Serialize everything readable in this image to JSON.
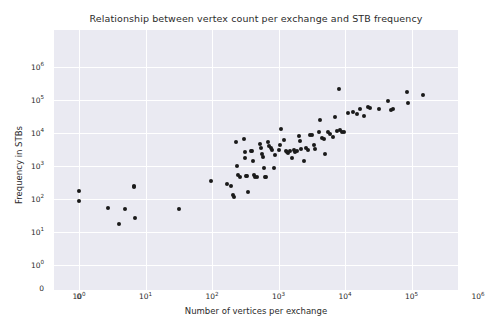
{
  "chart_data": {
    "type": "scatter",
    "title": "Relationship between vertex count per exchange and STB frequency",
    "xlabel": "Number of vertices per exchange",
    "ylabel": "Frequency in STBs",
    "xscale": "symlog",
    "yscale": "symlog",
    "xlim": [
      0,
      1000000
    ],
    "ylim": [
      0,
      1000000
    ],
    "grid": true,
    "legend": null,
    "marker_color": "#1a1a1a",
    "plot_bg_color": "#eaeaf2",
    "grid_color": "#ffffff",
    "xticks": [
      {
        "label": "0",
        "exp": null,
        "base": "0"
      },
      {
        "label": "10^0",
        "exp": "0",
        "base": "10"
      },
      {
        "label": "10^1",
        "exp": "1",
        "base": "10"
      },
      {
        "label": "10^2",
        "exp": "2",
        "base": "10"
      },
      {
        "label": "10^3",
        "exp": "3",
        "base": "10"
      },
      {
        "label": "10^4",
        "exp": "4",
        "base": "10"
      },
      {
        "label": "10^5",
        "exp": "5",
        "base": "10"
      },
      {
        "label": "10^6",
        "exp": "6",
        "base": "10"
      }
    ],
    "yticks": [
      {
        "label": "0",
        "exp": null,
        "base": "0"
      },
      {
        "label": "10^0",
        "exp": "0",
        "base": "10"
      },
      {
        "label": "10^1",
        "exp": "1",
        "base": "10"
      },
      {
        "label": "10^2",
        "exp": "2",
        "base": "10"
      },
      {
        "label": "10^3",
        "exp": "3",
        "base": "10"
      },
      {
        "label": "10^4",
        "exp": "4",
        "base": "10"
      },
      {
        "label": "10^5",
        "exp": "5",
        "base": "10"
      },
      {
        "label": "10^6",
        "exp": "6",
        "base": "10"
      }
    ],
    "points": [
      {
        "x": 1,
        "y": 180
      },
      {
        "x": 1,
        "y": 88
      },
      {
        "x": 2.7,
        "y": 55
      },
      {
        "x": 4,
        "y": 17
      },
      {
        "x": 5,
        "y": 50
      },
      {
        "x": 6.8,
        "y": 250
      },
      {
        "x": 6.8,
        "y": 230
      },
      {
        "x": 7,
        "y": 27
      },
      {
        "x": 32,
        "y": 49
      },
      {
        "x": 95,
        "y": 350
      },
      {
        "x": 170,
        "y": 290
      },
      {
        "x": 195,
        "y": 250
      },
      {
        "x": 210,
        "y": 135
      },
      {
        "x": 215,
        "y": 118
      },
      {
        "x": 230,
        "y": 5200
      },
      {
        "x": 240,
        "y": 1000
      },
      {
        "x": 250,
        "y": 520
      },
      {
        "x": 260,
        "y": 480
      },
      {
        "x": 300,
        "y": 6800
      },
      {
        "x": 310,
        "y": 2600
      },
      {
        "x": 315,
        "y": 1800
      },
      {
        "x": 330,
        "y": 510
      },
      {
        "x": 340,
        "y": 500
      },
      {
        "x": 350,
        "y": 165
      },
      {
        "x": 380,
        "y": 2800
      },
      {
        "x": 400,
        "y": 2900
      },
      {
        "x": 420,
        "y": 1400
      },
      {
        "x": 430,
        "y": 520
      },
      {
        "x": 450,
        "y": 470
      },
      {
        "x": 470,
        "y": 480
      },
      {
        "x": 520,
        "y": 4500
      },
      {
        "x": 540,
        "y": 3600
      },
      {
        "x": 560,
        "y": 2300
      },
      {
        "x": 580,
        "y": 1900
      },
      {
        "x": 600,
        "y": 900
      },
      {
        "x": 620,
        "y": 470
      },
      {
        "x": 640,
        "y": 450
      },
      {
        "x": 700,
        "y": 5200
      },
      {
        "x": 720,
        "y": 3900
      },
      {
        "x": 760,
        "y": 3400
      },
      {
        "x": 800,
        "y": 3100
      },
      {
        "x": 850,
        "y": 880
      },
      {
        "x": 900,
        "y": 2100
      },
      {
        "x": 1000,
        "y": 3000
      },
      {
        "x": 1050,
        "y": 4300
      },
      {
        "x": 1100,
        "y": 13000
      },
      {
        "x": 1200,
        "y": 6100
      },
      {
        "x": 1300,
        "y": 2900
      },
      {
        "x": 1350,
        "y": 2600
      },
      {
        "x": 1400,
        "y": 2400
      },
      {
        "x": 1500,
        "y": 2800
      },
      {
        "x": 1600,
        "y": 1800
      },
      {
        "x": 1700,
        "y": 3000
      },
      {
        "x": 1800,
        "y": 2700
      },
      {
        "x": 1900,
        "y": 2900
      },
      {
        "x": 2000,
        "y": 8000
      },
      {
        "x": 2100,
        "y": 5800
      },
      {
        "x": 2200,
        "y": 3300
      },
      {
        "x": 2400,
        "y": 1400
      },
      {
        "x": 2600,
        "y": 3400
      },
      {
        "x": 2800,
        "y": 3100
      },
      {
        "x": 3000,
        "y": 9000
      },
      {
        "x": 3200,
        "y": 8400
      },
      {
        "x": 3400,
        "y": 4200
      },
      {
        "x": 3600,
        "y": 3200
      },
      {
        "x": 4000,
        "y": 11000
      },
      {
        "x": 4200,
        "y": 25000
      },
      {
        "x": 4500,
        "y": 7000
      },
      {
        "x": 4800,
        "y": 6500
      },
      {
        "x": 5000,
        "y": 2300
      },
      {
        "x": 5500,
        "y": 10500
      },
      {
        "x": 6000,
        "y": 9500
      },
      {
        "x": 6500,
        "y": 7800
      },
      {
        "x": 7000,
        "y": 30000
      },
      {
        "x": 7500,
        "y": 11500
      },
      {
        "x": 8000,
        "y": 210000
      },
      {
        "x": 8500,
        "y": 12000
      },
      {
        "x": 9000,
        "y": 11000
      },
      {
        "x": 9500,
        "y": 10500
      },
      {
        "x": 11000,
        "y": 40000
      },
      {
        "x": 13000,
        "y": 42000
      },
      {
        "x": 15000,
        "y": 38000
      },
      {
        "x": 17000,
        "y": 55000
      },
      {
        "x": 19000,
        "y": 33000
      },
      {
        "x": 22000,
        "y": 60000
      },
      {
        "x": 24000,
        "y": 58000
      },
      {
        "x": 32000,
        "y": 52000
      },
      {
        "x": 45000,
        "y": 95000
      },
      {
        "x": 50000,
        "y": 50000
      },
      {
        "x": 52000,
        "y": 55000
      },
      {
        "x": 85000,
        "y": 170000
      },
      {
        "x": 90000,
        "y": 80000
      },
      {
        "x": 150000,
        "y": 140000
      }
    ]
  }
}
